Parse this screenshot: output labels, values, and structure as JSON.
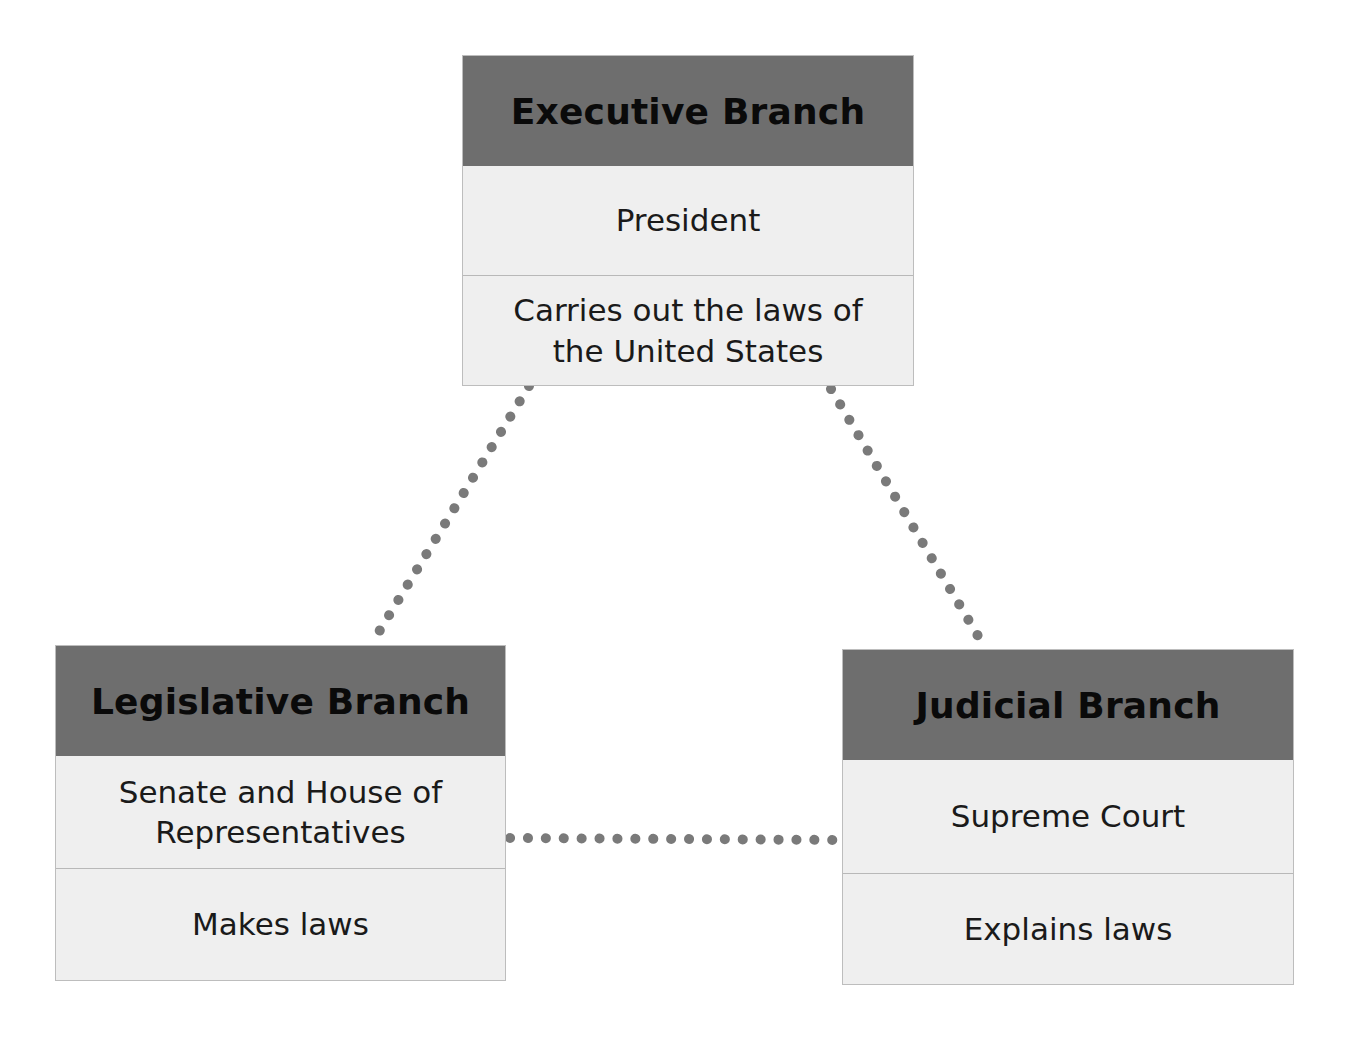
{
  "diagram": {
    "executive": {
      "title": "Executive Branch",
      "who": "President",
      "role": "Carries out the laws of the United States"
    },
    "legislative": {
      "title": "Legislative Branch",
      "who": "Senate and House of Representatives",
      "role": "Makes laws"
    },
    "judicial": {
      "title": "Judicial Branch",
      "who": "Supreme Court",
      "role": "Explains laws"
    },
    "connectors": [
      {
        "from": "executive",
        "to": "legislative",
        "style": "dotted"
      },
      {
        "from": "executive",
        "to": "judicial",
        "style": "dotted"
      },
      {
        "from": "legislative",
        "to": "judicial",
        "style": "dotted"
      }
    ],
    "colors": {
      "header_fill": "#6e6e6e",
      "body_fill": "#efefef",
      "dot_color": "#7a7a7a"
    }
  }
}
